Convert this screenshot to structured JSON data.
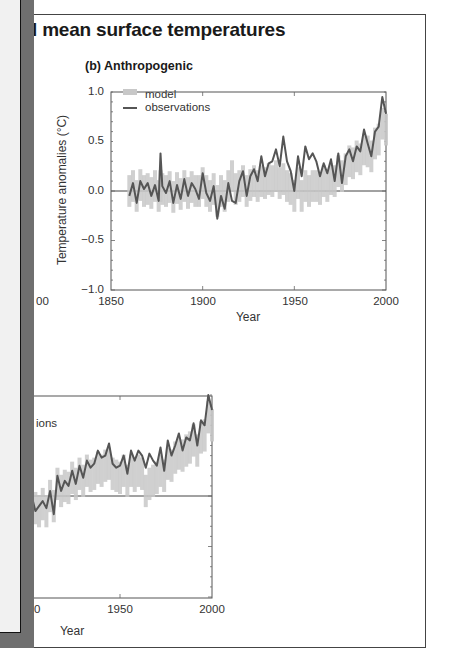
{
  "figure": {
    "title_fragment": "l mean surface temperatures",
    "clipped_tick_label": "00",
    "clipped_bottom_tick": "0",
    "bottom_legend_fragment": "ions"
  },
  "colors": {
    "observations": "#555555",
    "model": "#c8c8c8",
    "overlay_panel": "#f1f1f1",
    "overlay_shadow": "#6f6f6f"
  },
  "chart_data": [
    {
      "type": "line",
      "title": "(b) Anthropogenic",
      "xlabel": "Year",
      "ylabel": "Temperature anomalies (°C)",
      "xlim": [
        1850,
        2000
      ],
      "ylim": [
        -1.0,
        1.0
      ],
      "xticks": [
        "1850",
        "1900",
        "1950",
        "2000"
      ],
      "yticks": [
        "1.0",
        "0.5",
        "0.0",
        "-0.5",
        "-1.0"
      ],
      "ytick_labels": [
        "1.0",
        "0.5",
        "0.0",
        "−0.5",
        "−1.0"
      ],
      "legend": [
        "model",
        "observations"
      ],
      "legend_position": "upper left",
      "zero_line": true,
      "x": [
        1860,
        1862,
        1864,
        1866,
        1868,
        1870,
        1872,
        1874,
        1876,
        1877,
        1878,
        1880,
        1882,
        1884,
        1886,
        1888,
        1890,
        1892,
        1894,
        1896,
        1898,
        1900,
        1902,
        1904,
        1906,
        1908,
        1910,
        1912,
        1914,
        1916,
        1918,
        1920,
        1922,
        1924,
        1926,
        1928,
        1930,
        1932,
        1934,
        1936,
        1938,
        1940,
        1942,
        1944,
        1946,
        1948,
        1950,
        1952,
        1954,
        1956,
        1958,
        1960,
        1962,
        1964,
        1966,
        1968,
        1970,
        1972,
        1974,
        1976,
        1978,
        1980,
        1982,
        1984,
        1986,
        1988,
        1990,
        1992,
        1994,
        1996,
        1998,
        2000
      ],
      "series": [
        {
          "name": "observations",
          "values": [
            -0.05,
            0.08,
            -0.12,
            0.1,
            0.02,
            0.08,
            -0.05,
            0.06,
            -0.1,
            0.38,
            0.05,
            -0.02,
            0.1,
            -0.12,
            0.06,
            -0.08,
            0.12,
            -0.05,
            0.08,
            0.02,
            -0.08,
            0.18,
            -0.02,
            -0.1,
            0.05,
            -0.28,
            -0.05,
            -0.18,
            0.08,
            -0.1,
            -0.12,
            0.1,
            0.2,
            -0.05,
            0.15,
            0.22,
            0.1,
            0.35,
            0.15,
            0.28,
            0.3,
            0.42,
            0.25,
            0.55,
            0.3,
            0.2,
            0.0,
            0.35,
            0.15,
            0.45,
            0.32,
            0.38,
            0.3,
            0.15,
            0.28,
            0.18,
            0.32,
            0.1,
            0.38,
            0.08,
            0.35,
            0.42,
            0.3,
            0.45,
            0.4,
            0.62,
            0.48,
            0.35,
            0.6,
            0.65,
            0.95,
            0.78
          ]
        },
        {
          "name": "model",
          "values": [
            0.0,
            0.05,
            -0.05,
            0.06,
            0.0,
            0.02,
            -0.02,
            0.05,
            -0.05,
            0.05,
            0.02,
            0.0,
            0.04,
            -0.06,
            0.03,
            -0.03,
            0.05,
            -0.02,
            0.04,
            0.0,
            0.0,
            0.08,
            0.0,
            -0.05,
            0.02,
            -0.1,
            0.0,
            -0.05,
            0.05,
            0.15,
            0.02,
            0.05,
            0.1,
            0.0,
            0.06,
            0.1,
            0.05,
            0.1,
            0.08,
            0.12,
            0.1,
            0.15,
            0.08,
            0.12,
            0.05,
            0.02,
            -0.05,
            0.08,
            -0.05,
            0.05,
            0.0,
            0.05,
            0.05,
            0.02,
            0.1,
            0.05,
            0.12,
            0.1,
            0.2,
            0.15,
            0.22,
            0.3,
            0.28,
            0.35,
            0.32,
            0.42,
            0.4,
            0.35,
            0.48,
            0.52,
            0.68,
            0.62
          ]
        }
      ]
    },
    {
      "type": "line",
      "title": "",
      "xlabel": "Year",
      "xlim": [
        1850,
        2000
      ],
      "visible_xticks": [
        "1950",
        "2000"
      ],
      "legend_fragment": "ions",
      "zero_line": true,
      "note": "partially hidden behind overlay panel on the left",
      "x": [
        1900,
        1902,
        1904,
        1906,
        1908,
        1910,
        1912,
        1914,
        1916,
        1918,
        1920,
        1922,
        1924,
        1926,
        1928,
        1930,
        1932,
        1934,
        1936,
        1938,
        1940,
        1942,
        1944,
        1946,
        1948,
        1950,
        1952,
        1954,
        1956,
        1958,
        1960,
        1962,
        1964,
        1966,
        1968,
        1970,
        1972,
        1974,
        1976,
        1978,
        1980,
        1982,
        1984,
        1986,
        1988,
        1990,
        1992,
        1994,
        1996,
        1998,
        2000
      ],
      "series": [
        {
          "name": "observations",
          "values": [
            -0.05,
            0.0,
            -0.15,
            -0.1,
            -0.05,
            -0.12,
            0.05,
            -0.18,
            0.2,
            0.05,
            0.15,
            0.1,
            0.25,
            0.12,
            0.3,
            0.18,
            0.35,
            0.28,
            0.32,
            0.45,
            0.38,
            0.4,
            0.52,
            0.32,
            0.28,
            0.3,
            0.4,
            0.22,
            0.45,
            0.35,
            0.45,
            0.4,
            0.28,
            0.42,
            0.35,
            0.3,
            0.48,
            0.25,
            0.55,
            0.4,
            0.5,
            0.62,
            0.45,
            0.58,
            0.55,
            0.72,
            0.5,
            0.75,
            0.7,
            1.0,
            0.85
          ]
        },
        {
          "name": "model",
          "values": [
            -0.08,
            -0.05,
            -0.12,
            -0.15,
            -0.08,
            -0.15,
            0.0,
            -0.1,
            0.12,
            0.05,
            0.1,
            0.08,
            0.18,
            0.12,
            0.22,
            0.15,
            0.25,
            0.2,
            0.22,
            0.28,
            0.25,
            0.3,
            0.32,
            0.22,
            0.2,
            0.18,
            0.25,
            0.15,
            0.25,
            0.2,
            0.25,
            0.22,
            0.05,
            0.12,
            0.15,
            0.18,
            0.25,
            0.2,
            0.32,
            0.3,
            0.38,
            0.42,
            0.4,
            0.45,
            0.48,
            0.55,
            0.45,
            0.58,
            0.6,
            0.78,
            0.7
          ]
        }
      ]
    }
  ]
}
